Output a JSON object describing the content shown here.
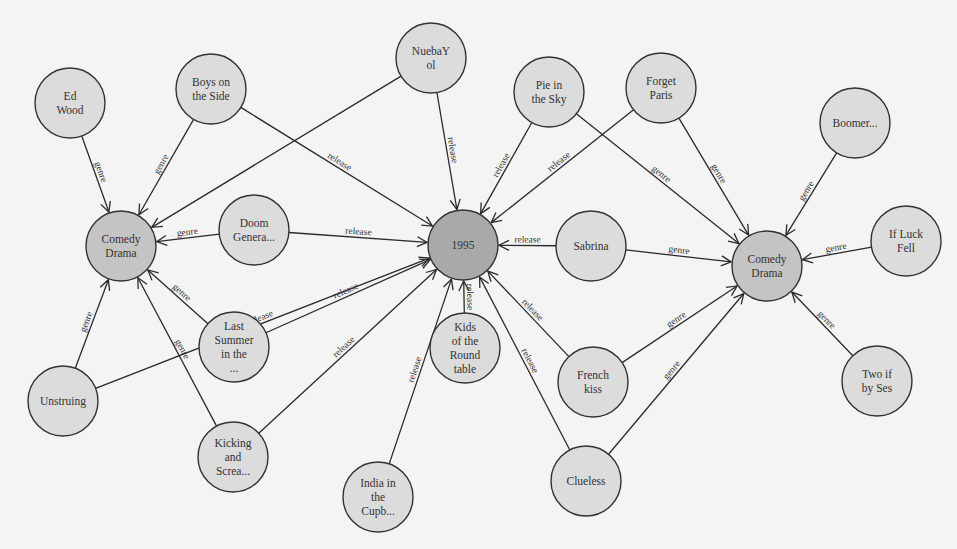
{
  "graph": {
    "colors": {
      "background": "#f4f4f4",
      "leaf_fill": "#dcdcdc",
      "hub_fill": "#a9a9a9",
      "genre_fill": "#c4c4c4",
      "stroke": "#333333"
    },
    "node_radius": 35,
    "nodes": [
      {
        "id": "ed_wood",
        "lines": [
          "Ed",
          "Wood"
        ],
        "x": 70,
        "y": 103,
        "kind": "leaf"
      },
      {
        "id": "boys_on_the_side",
        "lines": [
          "Boys on",
          "the Side"
        ],
        "x": 211,
        "y": 89,
        "kind": "leaf"
      },
      {
        "id": "nuebayol",
        "lines": [
          "NuebaY",
          "ol"
        ],
        "x": 431,
        "y": 58,
        "kind": "leaf"
      },
      {
        "id": "pie_in_the_sky",
        "lines": [
          "Pie in",
          "the Sky"
        ],
        "x": 549,
        "y": 92,
        "kind": "leaf"
      },
      {
        "id": "forget_paris",
        "lines": [
          "Forget",
          "Paris"
        ],
        "x": 661,
        "y": 88,
        "kind": "leaf"
      },
      {
        "id": "boomer",
        "lines": [
          "Boomer..."
        ],
        "x": 855,
        "y": 123,
        "kind": "leaf"
      },
      {
        "id": "if_luck_fell",
        "lines": [
          "If Luck",
          "Fell"
        ],
        "x": 906,
        "y": 241,
        "kind": "leaf"
      },
      {
        "id": "comedy_drama_left",
        "lines": [
          "Comedy",
          "Drama"
        ],
        "x": 121,
        "y": 246,
        "kind": "genre"
      },
      {
        "id": "doom_genera",
        "lines": [
          "Doom",
          "Genera..."
        ],
        "x": 254,
        "y": 230,
        "kind": "leaf"
      },
      {
        "id": "year_1995",
        "lines": [
          "1995"
        ],
        "x": 463,
        "y": 245,
        "kind": "hub"
      },
      {
        "id": "sabrina",
        "lines": [
          "Sabrina"
        ],
        "x": 591,
        "y": 246,
        "kind": "leaf"
      },
      {
        "id": "comedy_drama_right",
        "lines": [
          "Comedy",
          "Drama"
        ],
        "x": 767,
        "y": 266,
        "kind": "genre"
      },
      {
        "id": "last_summer",
        "lines": [
          "Last",
          "Summer",
          "in the",
          "..."
        ],
        "x": 234,
        "y": 347,
        "kind": "leaf"
      },
      {
        "id": "unstruing",
        "lines": [
          "Unstruing"
        ],
        "x": 63,
        "y": 401,
        "kind": "leaf"
      },
      {
        "id": "kids_round_table",
        "lines": [
          "Kids",
          "of the",
          "Round",
          "table"
        ],
        "x": 465,
        "y": 348,
        "kind": "leaf"
      },
      {
        "id": "french_kiss",
        "lines": [
          "French",
          "kiss"
        ],
        "x": 593,
        "y": 382,
        "kind": "leaf"
      },
      {
        "id": "kicking_screa",
        "lines": [
          "Kicking",
          "and",
          "Screa..."
        ],
        "x": 233,
        "y": 457,
        "kind": "leaf"
      },
      {
        "id": "india_cupb",
        "lines": [
          "India in",
          "the",
          "Cupb..."
        ],
        "x": 378,
        "y": 497,
        "kind": "leaf"
      },
      {
        "id": "clueless",
        "lines": [
          "Clueless"
        ],
        "x": 586,
        "y": 481,
        "kind": "leaf"
      },
      {
        "id": "two_if_by_ses",
        "lines": [
          "Two if",
          "by Ses"
        ],
        "x": 877,
        "y": 381,
        "kind": "leaf"
      }
    ],
    "edges": [
      {
        "from": "ed_wood",
        "to": "comedy_drama_left",
        "label": "genre"
      },
      {
        "from": "boys_on_the_side",
        "to": "comedy_drama_left",
        "label": "genre"
      },
      {
        "from": "nuebayol",
        "to": "comedy_drama_left",
        "label": ""
      },
      {
        "from": "doom_genera",
        "to": "comedy_drama_left",
        "label": "genre"
      },
      {
        "from": "last_summer",
        "to": "comedy_drama_left",
        "label": "genre"
      },
      {
        "from": "unstruing",
        "to": "comedy_drama_left",
        "label": "genre"
      },
      {
        "from": "kicking_screa",
        "to": "comedy_drama_left",
        "label": "genre"
      },
      {
        "from": "boys_on_the_side",
        "to": "year_1995",
        "label": "release"
      },
      {
        "from": "nuebayol",
        "to": "year_1995",
        "label": "release"
      },
      {
        "from": "pie_in_the_sky",
        "to": "year_1995",
        "label": "release"
      },
      {
        "from": "forget_paris",
        "to": "year_1995",
        "label": "release"
      },
      {
        "from": "doom_genera",
        "to": "year_1995",
        "label": "release"
      },
      {
        "from": "sabrina",
        "to": "year_1995",
        "label": "release"
      },
      {
        "from": "unstruing",
        "to": "year_1995",
        "label": "release"
      },
      {
        "from": "last_summer",
        "to": "year_1995",
        "label": "release"
      },
      {
        "from": "kicking_screa",
        "to": "year_1995",
        "label": "release"
      },
      {
        "from": "india_cupb",
        "to": "year_1995",
        "label": "release"
      },
      {
        "from": "kids_round_table",
        "to": "year_1995",
        "label": "release"
      },
      {
        "from": "clueless",
        "to": "year_1995",
        "label": "release"
      },
      {
        "from": "french_kiss",
        "to": "year_1995",
        "label": "release"
      },
      {
        "from": "pie_in_the_sky",
        "to": "comedy_drama_right",
        "label": "genre"
      },
      {
        "from": "forget_paris",
        "to": "comedy_drama_right",
        "label": "genre"
      },
      {
        "from": "boomer",
        "to": "comedy_drama_right",
        "label": "genre"
      },
      {
        "from": "if_luck_fell",
        "to": "comedy_drama_right",
        "label": "genre"
      },
      {
        "from": "sabrina",
        "to": "comedy_drama_right",
        "label": "genre"
      },
      {
        "from": "french_kiss",
        "to": "comedy_drama_right",
        "label": "genre"
      },
      {
        "from": "clueless",
        "to": "comedy_drama_right",
        "label": "genre"
      },
      {
        "from": "two_if_by_ses",
        "to": "comedy_drama_right",
        "label": "genre"
      }
    ]
  }
}
